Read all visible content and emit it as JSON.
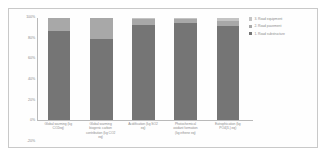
{
  "chart_data": {
    "type": "bar",
    "subtype": "100% stacked column",
    "title": "",
    "xlabel": "",
    "ylabel": "",
    "ylim": [
      -20,
      100
    ],
    "grid": false,
    "legend_position": "right",
    "ytick_labels": [
      "100%",
      "80%",
      "60%",
      "40%",
      "20%",
      "0%",
      "-20%"
    ],
    "ytick_values": [
      100,
      80,
      60,
      40,
      20,
      0,
      -20
    ],
    "categories": [
      "Global warming (kg CO2eq)",
      "Global warming biogenic carbon contribution (kg CO2 eq)",
      "Acidification (kg SO2 eq)",
      "Photochemical oxidant formation (kg ethene eq)",
      "Eutrophication (kg PO4(3-) eq)"
    ],
    "series": [
      {
        "name": "1. Road substructure",
        "color": "#757575",
        "values": [
          87,
          79,
          93,
          95,
          92
        ]
      },
      {
        "name": "2. Road pavement",
        "color": "#a8a8a8",
        "values": [
          13,
          21,
          6,
          4,
          5
        ]
      },
      {
        "name": "3. Road equipment",
        "color": "#c4c4c4",
        "values": [
          0,
          0,
          1,
          1,
          3
        ]
      }
    ]
  },
  "legend": {
    "items": [
      {
        "label": "3. Road equipment",
        "color": "#c4c4c4"
      },
      {
        "label": "2. Road pavement",
        "color": "#a8a8a8"
      },
      {
        "label": "1. Road substructure",
        "color": "#757575"
      }
    ]
  }
}
